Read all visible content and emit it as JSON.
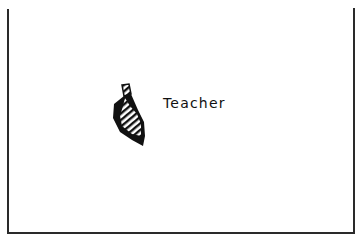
{
  "diagram": {
    "frame": {
      "sides": [
        "left",
        "right",
        "bottom"
      ],
      "color": "#2a2a2a"
    },
    "figure": {
      "icon": "teacher-figure-icon",
      "fill": "hatched",
      "color": "#111111"
    },
    "label": "Teacher"
  }
}
